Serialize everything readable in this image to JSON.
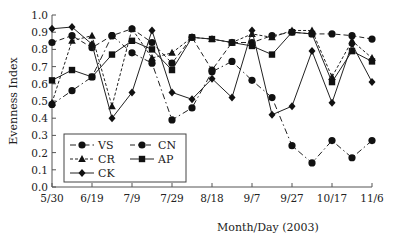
{
  "chart_data": {
    "type": "line",
    "title": "",
    "xlabel": "Month/Day (2003)",
    "ylabel": "Evenness Index",
    "ylim": [
      0.0,
      1.0
    ],
    "yticks": [
      "0.0",
      "0.1",
      "0.2",
      "0.3",
      "0.4",
      "0.5",
      "0.6",
      "0.7",
      "0.8",
      "0.9",
      "1.0"
    ],
    "xtick_labels": [
      "5/30",
      "6/19",
      "7/9",
      "7/29",
      "8/18",
      "9/7",
      "9/27",
      "10/17",
      "11/6"
    ],
    "x": [
      "5/30",
      "6/9",
      "6/19",
      "6/29",
      "7/9",
      "7/19",
      "7/29",
      "8/8",
      "8/18",
      "8/28",
      "9/7",
      "9/17",
      "9/27",
      "10/7",
      "10/17",
      "10/27",
      "11/6"
    ],
    "grid": false,
    "legend_position": "lower-left inside",
    "series": [
      {
        "name": "VS",
        "marker": "circle",
        "line": "dash-dot",
        "values": [
          0.48,
          0.56,
          0.64,
          0.88,
          0.78,
          0.72,
          0.39,
          0.46,
          0.67,
          0.73,
          0.62,
          0.52,
          0.24,
          0.14,
          0.27,
          0.17,
          0.27
        ]
      },
      {
        "name": "CN",
        "marker": "circle",
        "line": "dashed",
        "values": [
          0.84,
          0.88,
          0.81,
          0.88,
          0.92,
          0.84,
          0.72,
          0.87,
          0.68,
          0.84,
          0.84,
          0.88,
          0.9,
          0.89,
          0.89,
          0.88,
          0.86
        ]
      },
      {
        "name": "CR",
        "marker": "triangle",
        "line": "short-dash",
        "values": [
          0.49,
          0.85,
          0.88,
          0.47,
          0.92,
          0.75,
          0.78,
          0.87,
          0.86,
          0.84,
          0.89,
          0.87,
          0.91,
          0.91,
          0.64,
          0.85,
          0.75
        ]
      },
      {
        "name": "AP",
        "marker": "square",
        "line": "solid",
        "values": [
          0.62,
          0.68,
          0.64,
          0.77,
          0.85,
          0.8,
          0.68,
          0.87,
          0.86,
          0.84,
          0.82,
          0.77,
          0.9,
          0.89,
          0.61,
          0.79,
          0.73
        ]
      },
      {
        "name": "CK",
        "marker": "diamond",
        "line": "solid",
        "values": [
          0.92,
          0.93,
          0.83,
          0.4,
          0.55,
          0.91,
          0.55,
          0.51,
          0.63,
          0.52,
          0.91,
          0.42,
          0.47,
          0.79,
          0.49,
          0.83,
          0.61
        ]
      }
    ]
  }
}
